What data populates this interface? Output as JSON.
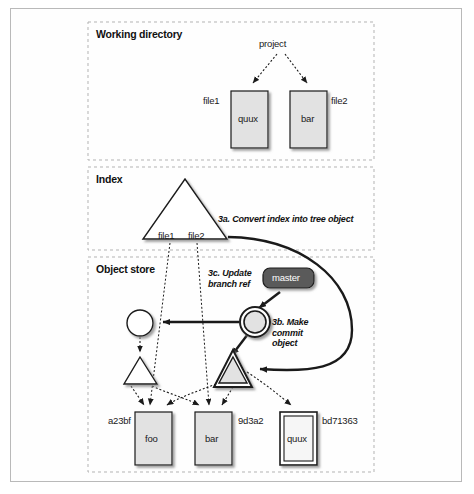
{
  "diagram": {
    "sections": [
      {
        "id": "working-directory",
        "label": "Working directory"
      },
      {
        "id": "index",
        "label": "Index"
      },
      {
        "id": "object-store",
        "label": "Object store"
      }
    ],
    "working_directory": {
      "root_label": "project",
      "files": [
        {
          "name_label": "file1",
          "content": "quux"
        },
        {
          "name_label": "file2",
          "content": "bar"
        }
      ]
    },
    "index": {
      "tree_labels": [
        "file1",
        "file2"
      ]
    },
    "object_store": {
      "branch_ref": "master",
      "blobs": [
        {
          "hash": "a23bf",
          "content": "foo"
        },
        {
          "hash": "9d3a2",
          "content": "bar"
        },
        {
          "hash": "bd71363",
          "content": "quux"
        }
      ]
    },
    "steps": [
      {
        "id": "3a",
        "text": "3a. Convert index into tree object"
      },
      {
        "id": "3b",
        "line1": "3b. Make",
        "line2": "commit",
        "line3": "object"
      },
      {
        "id": "3c",
        "line1": "3c. Update",
        "line2": "branch ref"
      }
    ],
    "colors": {
      "shape_fill": "#e2e2e2",
      "shape_fill_light": "#f2f2f2",
      "white_fill": "#ffffff",
      "stroke": "#1a1a1a",
      "master_fill": "#5a5a5a",
      "dashed_border": "#b0b0b0",
      "frame_border": "#b9b9b9",
      "shadow": "#9a9a9a"
    }
  }
}
